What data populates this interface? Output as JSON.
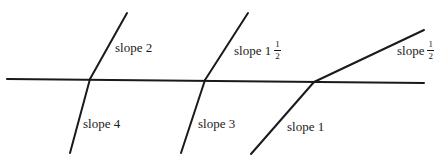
{
  "diagram": {
    "stroke_color": "#1a1a1a",
    "axis": {
      "x1": 7,
      "y1": 79,
      "x2": 424,
      "y2": 83
    },
    "kinks": [
      {
        "id": "kink-1",
        "vertex": {
          "x": 90,
          "y": 79
        },
        "upper_end": {
          "x": 127,
          "y": 13
        },
        "lower_end": {
          "x": 70,
          "y": 153
        },
        "upper_label": {
          "text": "slope 2",
          "whole": "",
          "num": "",
          "den": "",
          "x": 115,
          "y": 41
        },
        "lower_label": {
          "text": "slope 4",
          "whole": "",
          "num": "",
          "den": "",
          "x": 83,
          "y": 117
        }
      },
      {
        "id": "kink-2",
        "vertex": {
          "x": 205,
          "y": 80
        },
        "upper_end": {
          "x": 248,
          "y": 13
        },
        "lower_end": {
          "x": 181,
          "y": 153
        },
        "upper_label": {
          "text": "slope 1",
          "whole": "",
          "num": "1",
          "den": "2",
          "x": 234,
          "y": 40
        },
        "lower_label": {
          "text": "slope 3",
          "whole": "",
          "num": "",
          "den": "",
          "x": 198,
          "y": 117
        }
      },
      {
        "id": "kink-3",
        "vertex": {
          "x": 314,
          "y": 82
        },
        "upper_end": {
          "x": 424,
          "y": 30
        },
        "lower_end": {
          "x": 251,
          "y": 154
        },
        "upper_label": {
          "text": "slope",
          "whole": "",
          "num": "1",
          "den": "2",
          "x": 397,
          "y": 40
        },
        "lower_label": {
          "text": "slope 1",
          "whole": "",
          "num": "",
          "den": "",
          "x": 287,
          "y": 120
        }
      }
    ]
  }
}
